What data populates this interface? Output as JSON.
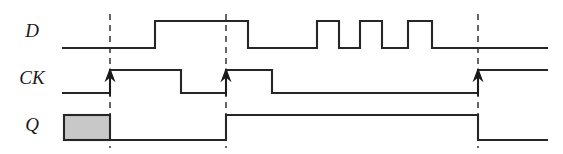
{
  "figure": {
    "width": 563,
    "height": 154,
    "background_color": "#ffffff",
    "line_color": "#262626",
    "marker_color": "#4a4a4a",
    "unknown_fill_color": "#c8c8c8"
  },
  "signals": {
    "d": {
      "label": "D",
      "label_x": 32,
      "label_y": 33,
      "low_y": 48,
      "high_y": 21,
      "start_x": 62,
      "end_x": 548,
      "initial_level": "low",
      "transitions": [
        {
          "x": 155,
          "to": "high"
        },
        {
          "x": 248,
          "to": "low"
        },
        {
          "x": 317,
          "to": "high"
        },
        {
          "x": 339,
          "to": "low"
        },
        {
          "x": 360,
          "to": "high"
        },
        {
          "x": 382,
          "to": "low"
        },
        {
          "x": 408,
          "to": "high"
        },
        {
          "x": 432,
          "to": "low"
        }
      ]
    },
    "ck": {
      "label": "CK",
      "label_x": 32,
      "label_y": 80,
      "low_y": 93,
      "high_y": 70,
      "start_x": 62,
      "end_x": 548,
      "initial_level": "low",
      "transitions": [
        {
          "x": 110,
          "to": "high"
        },
        {
          "x": 181,
          "to": "low"
        },
        {
          "x": 226,
          "to": "high"
        },
        {
          "x": 272,
          "to": "low"
        },
        {
          "x": 478,
          "to": "high"
        }
      ]
    },
    "q": {
      "label": "Q",
      "label_x": 32,
      "label_y": 127,
      "low_y": 140,
      "high_y": 115,
      "start_x": 62,
      "end_x": 548,
      "initial_level": "unknown",
      "unknown_region": {
        "x1": 64,
        "x2": 110,
        "y1": 115,
        "y2": 140
      },
      "transitions": [
        {
          "x": 110,
          "to": "low"
        },
        {
          "x": 226,
          "to": "high"
        },
        {
          "x": 478,
          "to": "low"
        }
      ]
    }
  },
  "clock_edge_markers": [
    {
      "x": 110,
      "y_top": 14,
      "y_bottom": 148,
      "arrow_tip_y": 70,
      "arrow_base_y": 96
    },
    {
      "x": 226,
      "y_top": 14,
      "y_bottom": 148,
      "arrow_tip_y": 70,
      "arrow_base_y": 96
    },
    {
      "x": 478,
      "y_top": 14,
      "y_bottom": 148,
      "arrow_tip_y": 70,
      "arrow_base_y": 96
    }
  ]
}
